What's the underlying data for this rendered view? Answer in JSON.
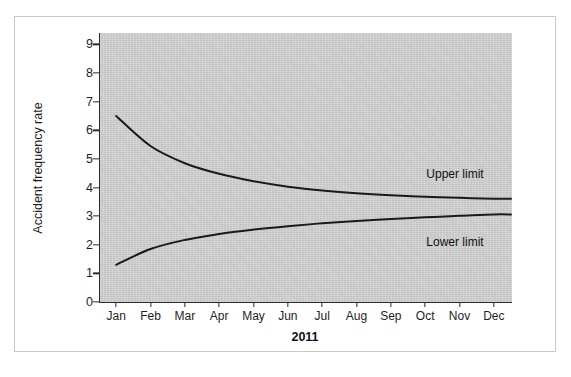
{
  "chart_data": {
    "type": "line",
    "title": "",
    "subtitle": "",
    "xlabel": "2011",
    "ylabel": "Accident frequency rate",
    "categories": [
      "Jan",
      "Feb",
      "Mar",
      "Apr",
      "May",
      "Jun",
      "Jul",
      "Aug",
      "Sep",
      "Oct",
      "Nov",
      "Dec"
    ],
    "ylim": [
      0,
      9.4
    ],
    "yticks": [
      0,
      1,
      2,
      3,
      4,
      5,
      6,
      7,
      8,
      9
    ],
    "ytick_labels": [
      "0",
      "1",
      "2",
      "3",
      "4",
      "5",
      "6",
      "7",
      "8",
      "9"
    ],
    "grid": false,
    "legend_position": "inline-annotations",
    "series": [
      {
        "name": "Upper limit",
        "color": "#1a1a1a",
        "values": [
          6.5,
          5.45,
          4.85,
          4.48,
          4.22,
          4.03,
          3.9,
          3.8,
          3.73,
          3.68,
          3.64,
          3.61
        ]
      },
      {
        "name": "Lower limit",
        "color": "#1a1a1a",
        "values": [
          1.3,
          1.85,
          2.17,
          2.38,
          2.53,
          2.65,
          2.75,
          2.83,
          2.9,
          2.96,
          3.01,
          3.06
        ]
      }
    ],
    "annotations": [
      {
        "text": "Upper limit",
        "series": "Upper limit"
      },
      {
        "text": "Lower limit",
        "series": "Lower limit"
      }
    ]
  },
  "figure": {
    "plot_background": "#d2d2d2",
    "frame_border": "#c8c8c8",
    "page_background": "#ffffff",
    "line_color": "#1a1a1a"
  }
}
